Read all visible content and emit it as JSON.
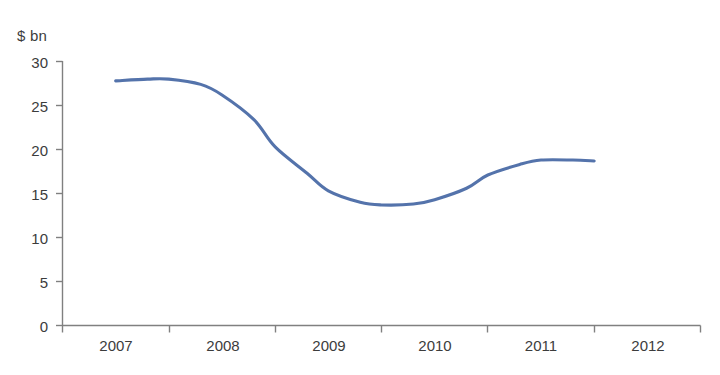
{
  "chart_data": {
    "type": "line",
    "title": "",
    "subtitle": "",
    "xlabel": "",
    "ylabel": "$ bn",
    "unit_label": "$ bn",
    "ylim": [
      0,
      30
    ],
    "y_ticks": [
      0,
      5,
      10,
      15,
      20,
      25,
      30
    ],
    "y_tick_labels": [
      "0",
      "5",
      "10",
      "15",
      "20",
      "25",
      "30"
    ],
    "grid": false,
    "legend": null,
    "legend_position": "none",
    "categories": [
      "2007",
      "2008",
      "2009",
      "2010",
      "2011",
      "2012"
    ],
    "x_tick_labels": [
      "2007",
      "2008",
      "2009",
      "2010",
      "2011",
      "2012"
    ],
    "series": [
      {
        "name": "",
        "color": "#5473ab",
        "smooth": true,
        "x": [
          2007.5,
          2007.8,
          2008.0,
          2008.3,
          2008.5,
          2008.8,
          2009.0,
          2009.3,
          2009.5,
          2009.8,
          2010.0,
          2010.3,
          2010.5,
          2010.8,
          2011.0,
          2011.3,
          2011.5,
          2011.8,
          2012.0
        ],
        "values": [
          27.8,
          28.0,
          28.0,
          27.4,
          26.2,
          23.4,
          20.3,
          17.3,
          15.3,
          14.0,
          13.7,
          13.8,
          14.3,
          15.6,
          17.1,
          18.3,
          18.8,
          18.8,
          18.7
        ],
        "annotations": [
          {
            "label": "start",
            "value": 27.8
          },
          {
            "label": "peak",
            "value": 28.0
          },
          {
            "label": "trough",
            "value": 13.7
          },
          {
            "label": "end",
            "value": 18.7
          }
        ]
      }
    ],
    "axis_color": "#808080",
    "plot_background": "#ffffff"
  }
}
